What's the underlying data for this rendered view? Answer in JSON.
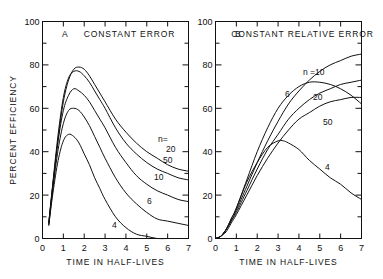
{
  "figure": {
    "background": "#ffffff",
    "ink_color": "#111111"
  },
  "chart_data": [
    {
      "type": "line",
      "panel_letter": "A",
      "title": "CONSTANT  ERROR",
      "xlabel": "TIME  IN  HALF-LIVES",
      "ylabel": "PERCENT  EFFICIENCY",
      "xlim": [
        0,
        7
      ],
      "ylim": [
        0,
        100
      ],
      "xticks": [
        0,
        1,
        2,
        3,
        4,
        5,
        6,
        7
      ],
      "xticklabels": [
        "0",
        "1",
        "2",
        "3",
        "4",
        "5",
        "6",
        "7"
      ],
      "yticks": [
        0,
        20,
        40,
        60,
        80,
        100
      ],
      "yticklabels": [
        "0",
        "20",
        "40",
        "60",
        "80",
        "100"
      ],
      "minor_ytick_step": 10,
      "grid": false,
      "legend": "inline-curve-labels",
      "series": [
        {
          "name": "n=20",
          "label": "20",
          "x": [
            0.3,
            0.5,
            0.75,
            1.0,
            1.25,
            1.5,
            1.75,
            2.0,
            2.25,
            2.5,
            2.75,
            3.0,
            3.5,
            4.0,
            4.5,
            5.0,
            5.5,
            6.0,
            6.5,
            7.0
          ],
          "y": [
            7,
            25,
            46,
            63,
            73,
            78,
            79,
            78,
            75,
            71,
            67,
            63,
            55,
            49,
            44,
            40,
            37,
            34,
            32,
            31
          ]
        },
        {
          "name": "n=50",
          "label": "50",
          "x": [
            0.3,
            0.5,
            0.75,
            1.0,
            1.25,
            1.5,
            1.75,
            2.0,
            2.25,
            2.5,
            2.75,
            3.0,
            3.5,
            4.0,
            4.5,
            5.0,
            5.5,
            6.0,
            6.5,
            7.0
          ],
          "y": [
            7,
            26,
            48,
            65,
            74,
            77,
            77,
            75,
            72,
            68,
            64,
            60,
            51,
            44,
            39,
            35,
            32,
            30,
            28,
            27
          ]
        },
        {
          "name": "n=10",
          "label": "10",
          "x": [
            0.3,
            0.5,
            0.75,
            1.0,
            1.25,
            1.5,
            1.75,
            2.0,
            2.25,
            2.5,
            2.75,
            3.0,
            3.5,
            4.0,
            4.5,
            5.0,
            5.5,
            6.0,
            6.5,
            7.0
          ],
          "y": [
            7,
            25,
            45,
            59,
            66,
            69,
            68,
            66,
            63,
            59,
            55,
            51,
            42,
            35,
            29,
            25,
            22,
            20,
            18,
            17
          ]
        },
        {
          "name": "n=6",
          "label": "6",
          "x": [
            0.3,
            0.5,
            0.75,
            1.0,
            1.25,
            1.5,
            1.75,
            2.0,
            2.25,
            2.5,
            2.75,
            3.0,
            3.5,
            4.0,
            4.5,
            5.0,
            5.5,
            6.0,
            6.5,
            7.0
          ],
          "y": [
            6,
            23,
            41,
            53,
            59,
            60,
            59,
            56,
            52,
            47,
            42,
            37,
            28,
            21,
            16,
            12,
            9,
            8,
            7,
            6
          ]
        },
        {
          "name": "n=4",
          "label": "4",
          "x": [
            0.3,
            0.5,
            0.75,
            1.0,
            1.25,
            1.5,
            1.75,
            2.0,
            2.25,
            2.5,
            2.75,
            3.0,
            3.5,
            4.0,
            4.5,
            5.0,
            5.5,
            6.0,
            6.5,
            7.0
          ],
          "y": [
            6,
            21,
            36,
            45,
            48,
            47,
            44,
            39,
            34,
            28,
            23,
            18,
            10,
            5,
            2,
            1,
            0,
            0,
            0,
            0
          ]
        }
      ]
    },
    {
      "type": "line",
      "panel_letter": "B",
      "title": "CONSTANT  RELATIVE  ERROR",
      "xlabel": "TIME  IN  HALF-LIVES",
      "ylabel": "",
      "xlim": [
        0,
        7
      ],
      "ylim": [
        0,
        100
      ],
      "xticks": [
        0,
        1,
        2,
        3,
        4,
        5,
        6,
        7
      ],
      "xticklabels": [
        "0",
        "1",
        "2",
        "3",
        "4",
        "5",
        "6",
        "7"
      ],
      "yticks": [
        0,
        20,
        40,
        60,
        80,
        100
      ],
      "yticklabels": [
        "0",
        "20",
        "40",
        "60",
        "80",
        "100"
      ],
      "minor_ytick_step": 10,
      "grid": false,
      "legend": "inline-curve-labels",
      "series": [
        {
          "name": "n=10",
          "label": "n =10",
          "x": [
            0.0,
            0.25,
            0.5,
            0.75,
            1.0,
            1.5,
            2.0,
            2.5,
            3.0,
            3.5,
            4.0,
            4.5,
            5.0,
            5.5,
            6.0,
            6.5,
            7.0
          ],
          "y": [
            0,
            1,
            4,
            8,
            13,
            24,
            35,
            45,
            54,
            62,
            68,
            73,
            77,
            80,
            82,
            84,
            85
          ]
        },
        {
          "name": "n=20",
          "label": "20",
          "x": [
            0.0,
            0.25,
            0.5,
            0.75,
            1.0,
            1.5,
            2.0,
            2.5,
            3.0,
            3.5,
            4.0,
            4.5,
            5.0,
            5.5,
            6.0,
            6.5,
            7.0
          ],
          "y": [
            0,
            1,
            4,
            8,
            12,
            22,
            32,
            41,
            48,
            55,
            60,
            64,
            67,
            69,
            71,
            72,
            73
          ]
        },
        {
          "name": "n=50",
          "label": "50",
          "x": [
            0.0,
            0.25,
            0.5,
            0.75,
            1.0,
            1.5,
            2.0,
            2.5,
            3.0,
            3.5,
            4.0,
            4.5,
            5.0,
            5.5,
            6.0,
            6.5,
            7.0
          ],
          "y": [
            0,
            1,
            3,
            7,
            11,
            20,
            29,
            37,
            44,
            50,
            55,
            58,
            61,
            63,
            64,
            65,
            65
          ]
        },
        {
          "name": "n=6",
          "label": "6",
          "x": [
            0.0,
            0.25,
            0.5,
            0.75,
            1.0,
            1.5,
            2.0,
            2.5,
            3.0,
            3.5,
            4.0,
            4.5,
            5.0,
            5.5,
            6.0,
            6.5,
            7.0
          ],
          "y": [
            0,
            1,
            4,
            9,
            14,
            27,
            40,
            51,
            60,
            66,
            70,
            72,
            72,
            71,
            69,
            66,
            62
          ]
        },
        {
          "name": "n=4",
          "label": "4",
          "x": [
            0.0,
            0.25,
            0.5,
            0.75,
            1.0,
            1.5,
            2.0,
            2.5,
            3.0,
            3.25,
            3.5,
            4.0,
            4.5,
            5.0,
            5.5,
            6.0,
            6.5,
            7.0
          ],
          "y": [
            0,
            1,
            4,
            9,
            14,
            26,
            35,
            42,
            45,
            45,
            44,
            41,
            36,
            32,
            28,
            25,
            21,
            18
          ]
        }
      ]
    }
  ]
}
